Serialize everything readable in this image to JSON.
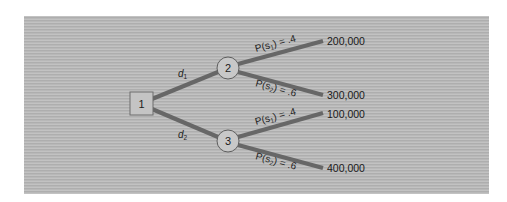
{
  "diagram": {
    "type": "decision-tree",
    "colors": {
      "panel_background": "#b4b4b4",
      "branch_line": "#676767",
      "node_fill": "#c6c6c6",
      "node_stroke": "#606060",
      "text": "#1c1c1c"
    },
    "decision_node": {
      "id": "1",
      "label": "1"
    },
    "decision_branches": [
      {
        "var": "d",
        "sub": "1",
        "to": "2"
      },
      {
        "var": "d",
        "sub": "2",
        "to": "3"
      }
    ],
    "chance_nodes": [
      {
        "id": "2",
        "label": "2",
        "outcomes": [
          {
            "prob_prefix": "P(s",
            "state_sub": "1",
            "prob_suffix": ") = .4",
            "payoff": "200,000"
          },
          {
            "prob_prefix": "P(s",
            "state_sub": "2",
            "prob_suffix": ") = .6",
            "payoff": "300,000"
          }
        ]
      },
      {
        "id": "3",
        "label": "3",
        "outcomes": [
          {
            "prob_prefix": "P(s",
            "state_sub": "1",
            "prob_suffix": ") = .4",
            "payoff": "100,000"
          },
          {
            "prob_prefix": "P(s",
            "state_sub": "2",
            "prob_suffix": ") = .6",
            "payoff": "400,000"
          }
        ]
      }
    ]
  }
}
